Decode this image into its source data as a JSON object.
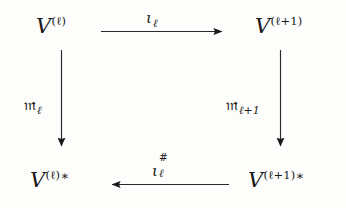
{
  "diagram": {
    "kind": "commutative-square",
    "ink_color": "#19191b",
    "background_color": "#fdfdfc",
    "nodes": [
      {
        "id": "top-left",
        "name": "node-v-ell",
        "base": "V",
        "superscript": "(ℓ)",
        "star": "",
        "plain_text": "V^(ℓ)"
      },
      {
        "id": "top-right",
        "name": "node-v-ell-plus-1",
        "base": "V",
        "superscript": "(ℓ+1)",
        "star": "",
        "plain_text": "V^(ℓ+1)"
      },
      {
        "id": "bottom-left",
        "name": "node-v-ell-dual",
        "base": "V",
        "superscript": "(ℓ)",
        "star": "∗",
        "plain_text": "V^(ℓ)*"
      },
      {
        "id": "bottom-right",
        "name": "node-v-ell-plus-1-dual",
        "base": "V",
        "superscript": "(ℓ+1)",
        "star": "∗",
        "plain_text": "V^(ℓ+1)*"
      }
    ],
    "arrows": [
      {
        "id": "top",
        "name": "arrow-top-iota-ell",
        "direction": "right",
        "from": "top-left",
        "to": "top-right",
        "label_symbol": "ι",
        "label_subscript": "ℓ",
        "label_superscript": "",
        "plain_text": "ι_ℓ"
      },
      {
        "id": "left",
        "name": "arrow-left-m-ell",
        "direction": "down",
        "from": "top-left",
        "to": "bottom-left",
        "label_symbol": "𝔪",
        "label_subscript": "ℓ",
        "label_superscript": "",
        "plain_text": "m_ℓ"
      },
      {
        "id": "right",
        "name": "arrow-right-m-ell-plus-1",
        "direction": "down",
        "from": "top-right",
        "to": "bottom-right",
        "label_symbol": "𝔪",
        "label_subscript": "ℓ+1",
        "label_superscript": "",
        "plain_text": "m_(ℓ+1)"
      },
      {
        "id": "bottom",
        "name": "arrow-bottom-iota-sharp-ell",
        "direction": "left",
        "from": "bottom-right",
        "to": "bottom-left",
        "label_symbol": "ι",
        "label_subscript": "ℓ",
        "label_superscript": "#",
        "plain_text": "ι^#_ℓ"
      }
    ]
  }
}
